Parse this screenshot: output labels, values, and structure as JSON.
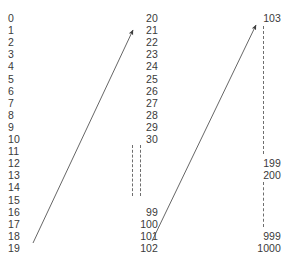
{
  "diagram": {
    "background_color": "#ffffff",
    "text_color": "#3a3a3a",
    "line_color": "#555555",
    "dash_color": "#6e6e6e",
    "width": 288,
    "height": 258
  },
  "columns": {
    "left": {
      "name": "index-column",
      "align": "left",
      "x": 8,
      "start_y": 12,
      "row_height": 12.1,
      "labels": [
        "0",
        "1",
        "2",
        "3",
        "4",
        "5",
        "6",
        "7",
        "8",
        "9",
        "10",
        "11",
        "12",
        "13",
        "14",
        "15",
        "16",
        "17",
        "18",
        "19"
      ]
    },
    "middle": {
      "name": "middle-value-column",
      "align": "right",
      "right_x": 158,
      "top_labels": [
        "20",
        "21",
        "22",
        "23",
        "24",
        "25",
        "26",
        "27",
        "28",
        "29",
        "30"
      ],
      "top_start_y": 12,
      "bottom_labels": [
        "99",
        "100",
        "101",
        "102"
      ],
      "bottom_start_y": 206,
      "row_height": 12.1,
      "ellipsis": {
        "name": "middle-ellipsis",
        "style": "dashed-vertical",
        "count": 2,
        "x_positions": [
          132,
          140
        ],
        "top_y": 145,
        "bottom_y": 196
      }
    },
    "right": {
      "name": "right-value-column",
      "align": "right",
      "right_x": 281,
      "row_height": 12.1,
      "groups": [
        {
          "labels": [
            "103"
          ],
          "start_y": 12
        },
        {
          "labels": [
            "199",
            "200"
          ],
          "start_y": 157
        },
        {
          "labels": [
            "999",
            "1000"
          ],
          "start_y": 230
        }
      ],
      "ellipsis": [
        {
          "name": "right-ellipsis-upper",
          "style": "dashed-vertical",
          "x": 263,
          "top_y": 26,
          "bottom_y": 154
        },
        {
          "name": "right-ellipsis-lower",
          "style": "dashed-vertical",
          "x": 263,
          "top_y": 182,
          "bottom_y": 227
        }
      ]
    }
  },
  "arrows": [
    {
      "name": "arrow-left-to-middle",
      "x1": 33,
      "y1": 243,
      "x2": 133,
      "y2": 30
    },
    {
      "name": "arrow-middle-to-right",
      "x1": 152,
      "y1": 241,
      "x2": 256,
      "y2": 25
    }
  ]
}
